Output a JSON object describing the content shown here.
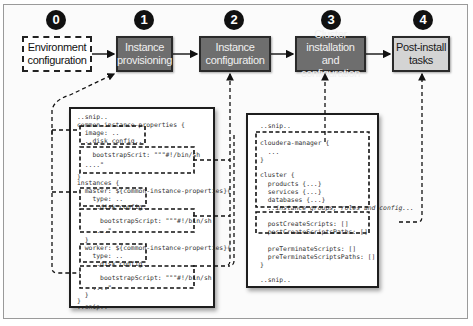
{
  "colors": {
    "stage_dark": "#6e6e6e",
    "stage_light": "#d4d4d4",
    "border": "#2a2a2a",
    "number_badge": "#111111"
  },
  "stages": [
    {
      "number": "0",
      "label_line1": "Environment",
      "label_line2": "configuration",
      "style": "dashed"
    },
    {
      "number": "1",
      "label_line1": "Instance",
      "label_line2": "provisioning",
      "style": "dark"
    },
    {
      "number": "2",
      "label_line1": "Instance",
      "label_line2": "configuration",
      "style": "dark"
    },
    {
      "number": "3",
      "label_line1": "Cluster installation",
      "label_line2": "and configuration",
      "style": "dark"
    },
    {
      "number": "4",
      "label_line1": "Post-install",
      "label_line2": "tasks",
      "style": "light"
    }
  ],
  "left_code": {
    "lines": [
      "..snip..",
      "common-instance-properties {",
      "  image: ..",
      "  ..disk config..",
      "    bootstrapScrit: \"\"\"#!/bin/sh",
      "  ....\"",
      "}",
      "instances {",
      "  master: ${common-instance-properties}{",
      "    type: ..",
      "    ..disk config..",
      "      bootstrapScript: \"\"\"#!/bin/sh",
      "    ....\"",
      "  }",
      "  worker: ${common-instance-properties}{",
      "    type: ..",
      "    ..disk config..",
      "      bootstrapScript: \"\"\"#!/bin/sh",
      "    ....\"",
      "  }",
      "}",
      "..snip.."
    ]
  },
  "right_code": {
    "lines": [
      "..snip..",
      "cloudera-manager {",
      "  ...",
      "}",
      "cluster {",
      "  products {...}",
      "  services {...}",
      "  databases {...}",
      "  ..instance groups, roles and config...",
      "  postCreateScripts: []",
      "  postCreateScriptsPaths: []",
      "  preTerminateScripts: []",
      "  preTerminateScriptsPaths: []",
      "}",
      "..snip.."
    ]
  }
}
